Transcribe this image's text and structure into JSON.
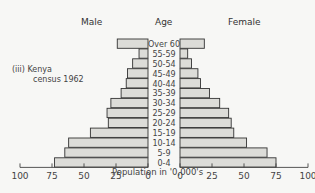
{
  "headers": {
    "left": "Male",
    "center": "Age",
    "right": "Female"
  },
  "annotation": {
    "line1": "(iii)  Kenya",
    "line2": "census  1962"
  },
  "chart_data": {
    "type": "bar",
    "subtype": "population-pyramid",
    "title": "(iii) Kenya census 1962",
    "xlabel": "Population in '0,000's",
    "ylabel": "Age",
    "categories": [
      "Over 60",
      "55-59",
      "50-54",
      "45-49",
      "40-44",
      "35-39",
      "30-34",
      "25-29",
      "20-24",
      "15-19",
      "10-14",
      "5-9",
      "0-4"
    ],
    "series": [
      {
        "name": "Male",
        "side": "left",
        "values": [
          24,
          7,
          12,
          16,
          17,
          21,
          29,
          32,
          31,
          45,
          62,
          65,
          73
        ]
      },
      {
        "name": "Female",
        "side": "right",
        "values": [
          19,
          6,
          9,
          14,
          16,
          23,
          31,
          38,
          40,
          42,
          52,
          68,
          75
        ]
      }
    ],
    "left_axis_ticks": [
      "100",
      "75",
      "50",
      "25",
      "0"
    ],
    "right_axis_ticks": [
      "0",
      "25",
      "50",
      "75",
      "100"
    ],
    "xlim": [
      0,
      100
    ],
    "grid": false,
    "legend": "none (side headers Male / Female)"
  }
}
